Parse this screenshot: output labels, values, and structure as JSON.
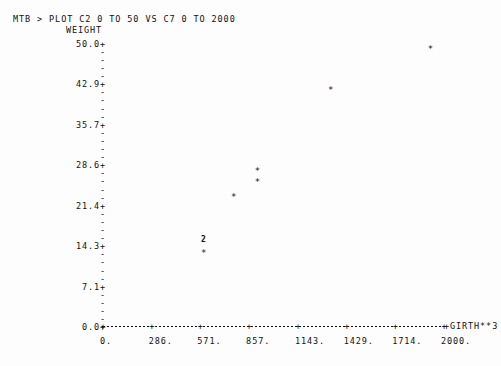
{
  "terminal": {
    "prompt": "MTB > ",
    "command": "PLOT C2 0 TO 50 VS C7 0 TO 2000",
    "full_line": "MTB > PLOT C2 0 TO 50 VS C7 0 TO 2000"
  },
  "chart_data": {
    "type": "scatter",
    "title": "",
    "ylabel": "WEIGHT",
    "xlabel": "GIRTH**3",
    "grid": false,
    "legend": null,
    "xlim": [
      0,
      2000
    ],
    "ylim": [
      0.0,
      50.0
    ],
    "x_tick_labels": [
      "0.",
      "286.",
      "571.",
      "857.",
      "1143.",
      "1429.",
      "1714.",
      "2000."
    ],
    "x_tick_values": [
      0,
      286,
      571,
      857,
      1143,
      1429,
      1714,
      2000
    ],
    "y_tick_labels": [
      "50.0+",
      "42.9+",
      "35.7+",
      "28.6+",
      "21.4+",
      "14.3+",
      "7.1+",
      "0.0+"
    ],
    "y_tick_values": [
      50.0,
      42.9,
      35.7,
      28.6,
      21.4,
      14.3,
      7.1,
      0.0
    ],
    "y_minor_tick_glyph": "-",
    "y_minor_per_major": 4,
    "x_axis_glyph": "+",
    "point_glyph": "*",
    "points": [
      {
        "x": 592,
        "y": 15.4,
        "glyph": "2",
        "count": 2,
        "label": "overlapping-pair"
      },
      {
        "x": 592,
        "y": 13.1,
        "glyph": "*",
        "count": 1,
        "label": ""
      },
      {
        "x": 768,
        "y": 23.0,
        "glyph": "*",
        "count": 1,
        "label": ""
      },
      {
        "x": 908,
        "y": 27.6,
        "glyph": "*",
        "count": 1,
        "label": ""
      },
      {
        "x": 908,
        "y": 25.6,
        "glyph": "*",
        "count": 1,
        "label": ""
      },
      {
        "x": 1337,
        "y": 41.9,
        "glyph": "*",
        "count": 1,
        "label": ""
      },
      {
        "x": 1923,
        "y": 49.1,
        "glyph": "*",
        "count": 1,
        "label": ""
      }
    ]
  },
  "colors": {
    "background": "#fdfdfd",
    "ink": "#111111"
  }
}
